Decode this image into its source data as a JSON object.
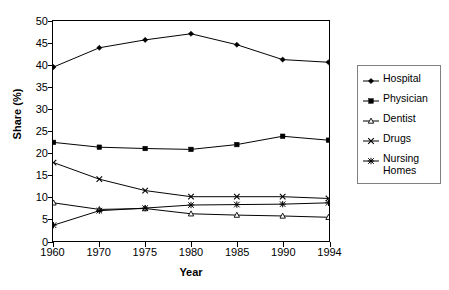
{
  "chart_data": {
    "type": "line",
    "title": "",
    "xlabel": "Year",
    "ylabel": "Share (%)",
    "categories": [
      "1960",
      "1970",
      "1975",
      "1980",
      "1985",
      "1990",
      "1994"
    ],
    "x": [
      1960,
      1970,
      1975,
      1980,
      1985,
      1990,
      1994
    ],
    "ylim": [
      0,
      50
    ],
    "yticks": [
      0,
      5,
      10,
      15,
      20,
      25,
      30,
      35,
      40,
      45,
      50
    ],
    "grid": false,
    "legend_position": "right-outside",
    "series": [
      {
        "name": "Hospital",
        "marker": "filled-diamond",
        "color": "#000000",
        "values": [
          39.6,
          44.0,
          45.8,
          47.2,
          44.7,
          41.3,
          40.7
        ]
      },
      {
        "name": "Physician",
        "marker": "filled-square",
        "color": "#000000",
        "values": [
          22.4,
          21.3,
          21.0,
          20.8,
          21.9,
          23.8,
          22.9
        ]
      },
      {
        "name": "Dentist",
        "marker": "open-triangle",
        "color": "#000000",
        "values": [
          8.6,
          7.1,
          7.3,
          6.1,
          5.8,
          5.6,
          5.3
        ]
      },
      {
        "name": "Drugs",
        "marker": "cross-x",
        "color": "#000000",
        "values": [
          17.8,
          14.0,
          11.4,
          10.0,
          10.0,
          10.0,
          9.6
        ]
      },
      {
        "name": "Nursing Homes",
        "marker": "asterisk",
        "color": "#000000",
        "values": [
          3.5,
          6.8,
          7.4,
          8.1,
          8.2,
          8.3,
          8.6
        ]
      }
    ]
  },
  "axes": {
    "y_title": "Share (%)",
    "x_title": "Year",
    "y_tick_labels": [
      "0",
      "5",
      "10",
      "15",
      "20",
      "25",
      "30",
      "35",
      "40",
      "45",
      "50"
    ],
    "x_tick_labels": [
      "1960",
      "1970",
      "1975",
      "1980",
      "1985",
      "1990",
      "1994"
    ]
  },
  "legend": {
    "items": [
      {
        "label": "Hospital"
      },
      {
        "label": "Physician"
      },
      {
        "label": "Dentist"
      },
      {
        "label": "Drugs"
      },
      {
        "label": "Nursing\nHomes"
      }
    ]
  }
}
